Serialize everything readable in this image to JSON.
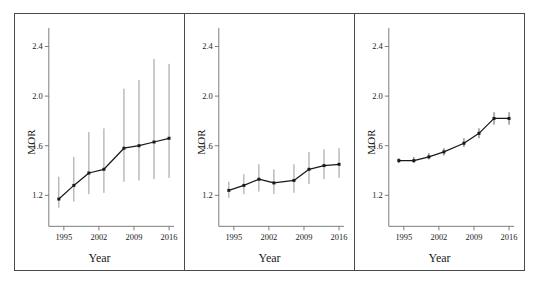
{
  "figure": {
    "background": "#ffffff",
    "frame_color": "#4a4a4a",
    "panel_count": 3
  },
  "chart_data": [
    {
      "type": "line",
      "panel_index": 1,
      "title": "",
      "xlabel": "Year",
      "ylabel": "MOR",
      "xlim": [
        1992,
        2017
      ],
      "ylim": [
        0.95,
        2.55
      ],
      "xticks": [
        1995,
        2002,
        2009,
        2016
      ],
      "xtick_labels": [
        "1995",
        "2002",
        "2009",
        "2016"
      ],
      "yticks": [
        1.2,
        1.6,
        2.0,
        2.4
      ],
      "ytick_labels": [
        "1.2",
        "1.6",
        "2.0",
        "2.4"
      ],
      "grid": false,
      "legend": "none",
      "marker": "filled-square",
      "line_color": "#1a1a1a",
      "errorbar_color": "#8c8c8c",
      "x": [
        1994,
        1997,
        2000,
        2003,
        2007,
        2010,
        2013,
        2016
      ],
      "values": [
        1.17,
        1.28,
        1.38,
        1.41,
        1.58,
        1.6,
        1.63,
        1.66
      ],
      "error_low": [
        1.1,
        1.15,
        1.21,
        1.22,
        1.31,
        1.32,
        1.33,
        1.34
      ],
      "error_high": [
        1.35,
        1.51,
        1.71,
        1.74,
        2.06,
        2.13,
        2.3,
        2.26
      ]
    },
    {
      "type": "line",
      "panel_index": 2,
      "title": "",
      "xlabel": "Year",
      "ylabel": "MOR",
      "xlim": [
        1992,
        2017
      ],
      "ylim": [
        0.95,
        2.55
      ],
      "xticks": [
        1995,
        2002,
        2009,
        2016
      ],
      "xtick_labels": [
        "1995",
        "2002",
        "2009",
        "2016"
      ],
      "yticks": [
        1.2,
        1.6,
        2.0,
        2.4
      ],
      "ytick_labels": [
        "1.2",
        "1.6",
        "2.0",
        "2.4"
      ],
      "grid": false,
      "legend": "none",
      "marker": "filled-square",
      "line_color": "#1a1a1a",
      "errorbar_color": "#8c8c8c",
      "x": [
        1994,
        1997,
        2000,
        2003,
        2007,
        2010,
        2013,
        2016
      ],
      "values": [
        1.24,
        1.28,
        1.33,
        1.3,
        1.32,
        1.41,
        1.44,
        1.45
      ],
      "error_low": [
        1.18,
        1.21,
        1.23,
        1.21,
        1.22,
        1.29,
        1.33,
        1.34
      ],
      "error_high": [
        1.31,
        1.37,
        1.45,
        1.41,
        1.45,
        1.55,
        1.57,
        1.58
      ]
    },
    {
      "type": "line",
      "panel_index": 3,
      "title": "",
      "xlabel": "Year",
      "ylabel": "MOR",
      "xlim": [
        1992,
        2017
      ],
      "ylim": [
        0.95,
        2.55
      ],
      "xticks": [
        1995,
        2002,
        2009,
        2016
      ],
      "xtick_labels": [
        "1995",
        "2002",
        "2009",
        "2016"
      ],
      "yticks": [
        1.2,
        1.6,
        2.0,
        2.4
      ],
      "ytick_labels": [
        "1.2",
        "1.6",
        "2.0",
        "2.4"
      ],
      "grid": false,
      "legend": "none",
      "marker": "filled-square",
      "line_color": "#1a1a1a",
      "errorbar_color": "#4a4a4a",
      "x": [
        1994,
        1997,
        2000,
        2003,
        2007,
        2010,
        2013,
        2016
      ],
      "values": [
        1.48,
        1.48,
        1.51,
        1.55,
        1.62,
        1.7,
        1.82,
        1.82
      ],
      "error_low": [
        1.46,
        1.46,
        1.49,
        1.52,
        1.59,
        1.66,
        1.77,
        1.77
      ],
      "error_high": [
        1.5,
        1.51,
        1.54,
        1.58,
        1.66,
        1.74,
        1.87,
        1.87
      ]
    }
  ]
}
